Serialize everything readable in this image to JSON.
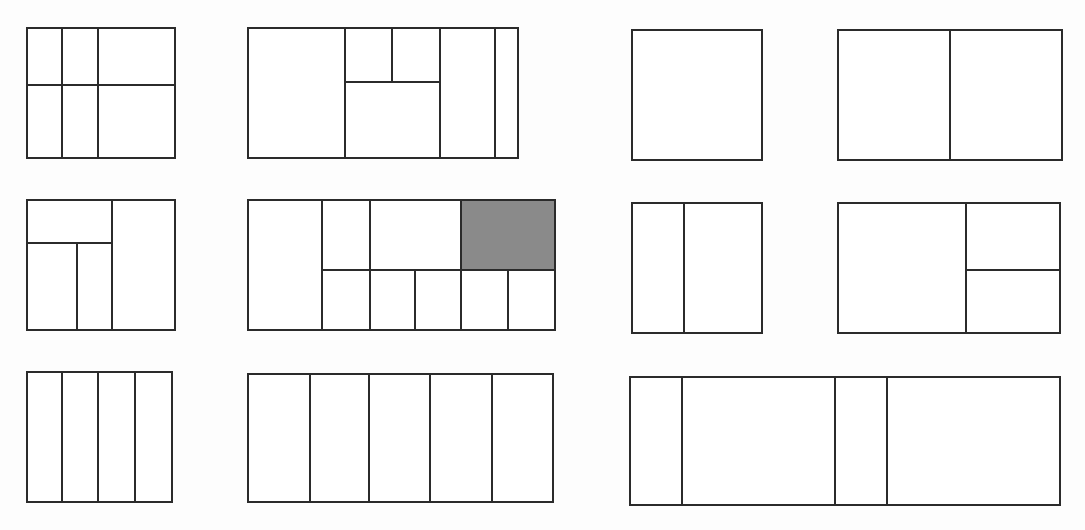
{
  "figure": {
    "canvas_width": 1085,
    "canvas_height": 530,
    "background_color": "#fdfdfd",
    "line_color": "#2b2b2b",
    "fill_color": "#ffffff",
    "shaded_color": "#8a8a8a",
    "line_width": 2.6,
    "panel_count": 11,
    "row_count": 3,
    "shaded_panel_id": "panel-6",
    "shaded_region_label": "top-right cell"
  },
  "panels": [
    {
      "id": "panel-1",
      "name": "row1-col1",
      "row": 1,
      "column": 1,
      "x": 27,
      "y": 28,
      "width": 148,
      "height": 130,
      "cell_count": 6,
      "dividers": [
        {
          "orientation": "vertical",
          "pos": 62,
          "from": 28,
          "to": 158
        },
        {
          "orientation": "vertical",
          "pos": 98,
          "from": 28,
          "to": 158
        },
        {
          "orientation": "horizontal",
          "pos": 85,
          "from": 27,
          "to": 175
        }
      ]
    },
    {
      "id": "panel-2",
      "name": "row1-col2",
      "row": 1,
      "column": 2,
      "x": 248,
      "y": 28,
      "width": 270,
      "height": 130,
      "cell_count": 6,
      "dividers": [
        {
          "orientation": "vertical",
          "pos": 345,
          "from": 28,
          "to": 158
        },
        {
          "orientation": "vertical",
          "pos": 440,
          "from": 28,
          "to": 158
        },
        {
          "orientation": "vertical",
          "pos": 495,
          "from": 28,
          "to": 158
        },
        {
          "orientation": "horizontal",
          "pos": 82,
          "from": 345,
          "to": 440
        },
        {
          "orientation": "vertical",
          "pos": 392,
          "from": 28,
          "to": 82
        }
      ]
    },
    {
      "id": "panel-3",
      "name": "row1-col3",
      "row": 1,
      "column": 3,
      "x": 632,
      "y": 30,
      "width": 130,
      "height": 130,
      "cell_count": 1,
      "dividers": []
    },
    {
      "id": "panel-4",
      "name": "row1-col4",
      "row": 1,
      "column": 4,
      "x": 838,
      "y": 30,
      "width": 224,
      "height": 130,
      "cell_count": 2,
      "dividers": [
        {
          "orientation": "vertical",
          "pos": 950,
          "from": 30,
          "to": 160
        }
      ]
    },
    {
      "id": "panel-5",
      "name": "row2-col1",
      "row": 2,
      "column": 1,
      "x": 27,
      "y": 200,
      "width": 148,
      "height": 130,
      "cell_count": 4,
      "dividers": [
        {
          "orientation": "vertical",
          "pos": 112,
          "from": 200,
          "to": 330
        },
        {
          "orientation": "horizontal",
          "pos": 243,
          "from": 27,
          "to": 112
        },
        {
          "orientation": "vertical",
          "pos": 77,
          "from": 243,
          "to": 330
        }
      ]
    },
    {
      "id": "panel-6",
      "name": "row2-col2",
      "row": 2,
      "column": 2,
      "x": 248,
      "y": 200,
      "width": 307,
      "height": 130,
      "cell_count": 9,
      "dividers": [
        {
          "orientation": "vertical",
          "pos": 322,
          "from": 200,
          "to": 330
        },
        {
          "orientation": "horizontal",
          "pos": 270,
          "from": 322,
          "to": 555
        },
        {
          "orientation": "vertical",
          "pos": 370,
          "from": 200,
          "to": 330
        },
        {
          "orientation": "vertical",
          "pos": 461,
          "from": 200,
          "to": 330
        },
        {
          "orientation": "vertical",
          "pos": 415,
          "from": 270,
          "to": 330
        },
        {
          "orientation": "vertical",
          "pos": 508,
          "from": 270,
          "to": 330
        }
      ],
      "shaded_cells": [
        {
          "x": 461,
          "y": 200,
          "width": 94,
          "height": 70
        }
      ]
    },
    {
      "id": "panel-7",
      "name": "row2-col3",
      "row": 2,
      "column": 3,
      "x": 632,
      "y": 203,
      "width": 130,
      "height": 130,
      "cell_count": 2,
      "dividers": [
        {
          "orientation": "vertical",
          "pos": 684,
          "from": 203,
          "to": 333
        }
      ]
    },
    {
      "id": "panel-8",
      "name": "row2-col4",
      "row": 2,
      "column": 4,
      "x": 838,
      "y": 203,
      "width": 222,
      "height": 130,
      "cell_count": 3,
      "dividers": [
        {
          "orientation": "vertical",
          "pos": 966,
          "from": 203,
          "to": 333
        },
        {
          "orientation": "horizontal",
          "pos": 270,
          "from": 966,
          "to": 1060
        }
      ]
    },
    {
      "id": "panel-9",
      "name": "row3-col1",
      "row": 3,
      "column": 1,
      "x": 27,
      "y": 372,
      "width": 145,
      "height": 130,
      "cell_count": 4,
      "dividers": [
        {
          "orientation": "vertical",
          "pos": 62,
          "from": 372,
          "to": 502
        },
        {
          "orientation": "vertical",
          "pos": 98,
          "from": 372,
          "to": 502
        },
        {
          "orientation": "vertical",
          "pos": 135,
          "from": 372,
          "to": 502
        }
      ]
    },
    {
      "id": "panel-10",
      "name": "row3-col2",
      "row": 3,
      "column": 2,
      "x": 248,
      "y": 374,
      "width": 305,
      "height": 128,
      "cell_count": 5,
      "dividers": [
        {
          "orientation": "vertical",
          "pos": 310,
          "from": 374,
          "to": 502
        },
        {
          "orientation": "vertical",
          "pos": 369,
          "from": 374,
          "to": 502
        },
        {
          "orientation": "vertical",
          "pos": 430,
          "from": 374,
          "to": 502
        },
        {
          "orientation": "vertical",
          "pos": 492,
          "from": 374,
          "to": 502
        }
      ]
    },
    {
      "id": "panel-11",
      "name": "row3-col3",
      "row": 3,
      "column": 3,
      "x": 630,
      "y": 377,
      "width": 430,
      "height": 128,
      "cell_count": 4,
      "dividers": [
        {
          "orientation": "vertical",
          "pos": 682,
          "from": 377,
          "to": 505
        },
        {
          "orientation": "vertical",
          "pos": 835,
          "from": 377,
          "to": 505
        },
        {
          "orientation": "vertical",
          "pos": 887,
          "from": 377,
          "to": 505
        }
      ]
    }
  ]
}
